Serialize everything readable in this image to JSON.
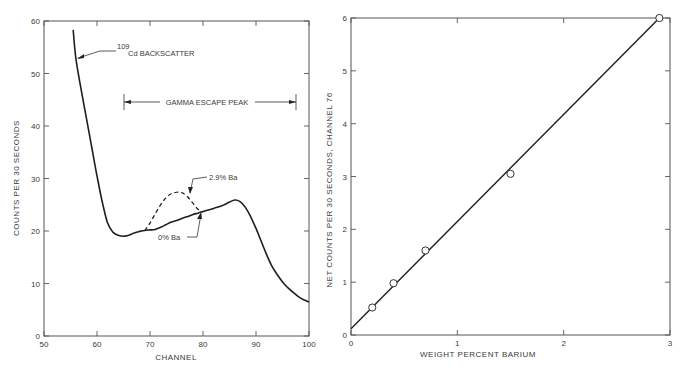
{
  "chart_data": [
    {
      "type": "line",
      "title": "",
      "xlabel": "CHANNEL",
      "ylabel": "COUNTS PER 30 SECONDS",
      "xlim": [
        50,
        100
      ],
      "ylim": [
        0,
        60
      ],
      "xticks": [
        50,
        60,
        70,
        80,
        90,
        100
      ],
      "yticks": [
        0,
        10,
        20,
        30,
        40,
        50,
        60
      ],
      "grid": false,
      "series": [
        {
          "name": "0% Ba",
          "style": "solid",
          "x": [
            55.5,
            56,
            57,
            58,
            59,
            60,
            61,
            62,
            63,
            64,
            65,
            66,
            67,
            68,
            69,
            70,
            71,
            72,
            73,
            74,
            75,
            76,
            77,
            78,
            79,
            80,
            81,
            82,
            83,
            84,
            85,
            86,
            87,
            88,
            89,
            90,
            91,
            92,
            93,
            94,
            95,
            96,
            97,
            98,
            99,
            100
          ],
          "y": [
            58.3,
            53,
            47,
            41.5,
            36,
            30.5,
            25.5,
            21.5,
            19.8,
            19.2,
            19.0,
            19.2,
            19.6,
            19.9,
            20.1,
            20.2,
            20.3,
            20.7,
            21.2,
            21.7,
            22.0,
            22.4,
            22.7,
            23.1,
            23.4,
            23.7,
            24.0,
            24.3,
            24.6,
            25.0,
            25.5,
            25.9,
            25.6,
            24.5,
            22.7,
            20.5,
            18.0,
            15.5,
            13.3,
            11.7,
            10.3,
            9.2,
            8.3,
            7.5,
            6.9,
            6.5
          ]
        },
        {
          "name": "2.9% Ba",
          "style": "dashed",
          "x": [
            69,
            70,
            71,
            72,
            73,
            74,
            75,
            76,
            77,
            78,
            79,
            80
          ],
          "y": [
            20.1,
            21.5,
            23.3,
            25.0,
            26.3,
            27.1,
            27.4,
            27.3,
            26.6,
            25.4,
            24.2,
            23.6
          ]
        }
      ],
      "annotations": [
        {
          "text_sup": "109",
          "text": "Cd BACKSCATTER",
          "points_to": [
            56.3,
            53
          ]
        },
        {
          "text": "GAMMA ESCAPE PEAK",
          "type": "bracket",
          "x_range": [
            65,
            97.5
          ],
          "y": 44.6
        },
        {
          "text": "2.9% Ba",
          "points_to": [
            77,
            26.3
          ]
        },
        {
          "text": "0% Ba",
          "points_to": [
            80.5,
            23.8
          ]
        }
      ]
    },
    {
      "type": "scatter",
      "title": "",
      "xlabel": "WEIGHT PERCENT BARIUM",
      "ylabel": "NET COUNTS PER 30 SECONDS, CHANNEL 76",
      "xlim": [
        0,
        3
      ],
      "ylim": [
        0,
        6
      ],
      "xticks": [
        0,
        1,
        2,
        3
      ],
      "yticks": [
        0,
        1,
        2,
        3,
        4,
        5,
        6
      ],
      "grid": false,
      "series": [
        {
          "name": "measured",
          "marker": "open-circle",
          "x": [
            0.2,
            0.4,
            0.7,
            1.5,
            2.9
          ],
          "y": [
            0.52,
            0.98,
            1.6,
            3.05,
            6.0
          ]
        },
        {
          "name": "linear fit",
          "style": "solid",
          "x": [
            0,
            2.9
          ],
          "y": [
            0.12,
            6.0
          ]
        }
      ]
    }
  ],
  "left": {
    "ylabel": "COUNTS PER 30 SECONDS",
    "xlabel": "CHANNEL",
    "xticks": [
      "50",
      "60",
      "70",
      "80",
      "90",
      "100"
    ],
    "yticks": [
      "0",
      "10",
      "20",
      "30",
      "40",
      "50",
      "60"
    ],
    "annot_cd_sup": "109",
    "annot_cd": "Cd BACKSCATTER",
    "annot_gamma": "GAMMA ESCAPE PEAK",
    "annot_29": "2.9% Ba",
    "annot_0": "0% Ba"
  },
  "right": {
    "ylabel": "NET COUNTS PER 30 SECONDS, CHANNEL 76",
    "xlabel": "WEIGHT PERCENT BARIUM",
    "xticks": [
      "0",
      "1",
      "2",
      "3"
    ],
    "yticks": [
      "0",
      "1",
      "2",
      "3",
      "4",
      "5",
      "6"
    ]
  }
}
